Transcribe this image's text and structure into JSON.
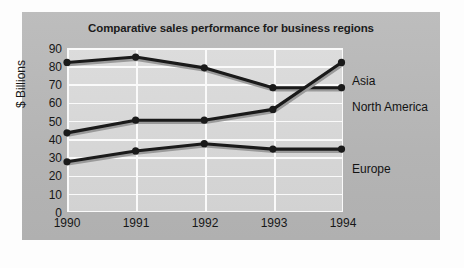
{
  "chart_data": {
    "type": "line",
    "title": "Comparative sales performance for business regions",
    "xlabel": "",
    "ylabel": "$ Billions",
    "categories": [
      "1990",
      "1991",
      "1992",
      "1993",
      "1994"
    ],
    "x": [
      1990,
      1991,
      1992,
      1993,
      1994
    ],
    "ylim": [
      0,
      90
    ],
    "yticks": [
      "0",
      "10",
      "20",
      "30",
      "40",
      "50",
      "60",
      "70",
      "80",
      "90"
    ],
    "grid": "horizontal-and-vertical",
    "legend_position": "right-end-of-line",
    "series": [
      {
        "name": "North America",
        "values": [
          82,
          85,
          79,
          68,
          68
        ],
        "color": "#1a1a1a"
      },
      {
        "name": "Asia",
        "values": [
          43,
          50,
          50,
          56,
          82
        ],
        "color": "#1a1a1a"
      },
      {
        "name": "Europe",
        "values": [
          27,
          33,
          37,
          34,
          34
        ],
        "color": "#1a1a1a"
      }
    ],
    "marker": "filled-circle",
    "panel_color": "#b9b9b9",
    "plot_color": "#d5d5d5",
    "gridline_color": "#fafafa"
  },
  "labels": {
    "asia": "Asia",
    "north_america": "North America",
    "europe": "Europe"
  },
  "yticks": {
    "t90": "90",
    "t80": "80",
    "t70": "70",
    "t60": "60",
    "t50": "50",
    "t40": "40",
    "t30": "30",
    "t20": "20",
    "t10": "10",
    "t0": "0"
  },
  "xticks": {
    "x1990": "1990",
    "x1991": "1991",
    "x1992": "1992",
    "x1993": "1993",
    "x1994": "1994"
  }
}
